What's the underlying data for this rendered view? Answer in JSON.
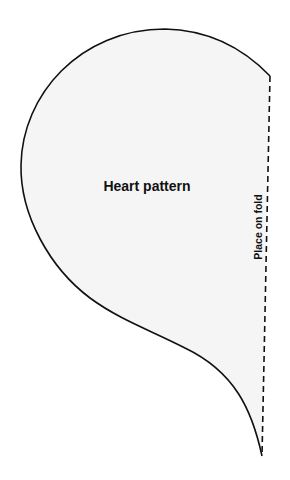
{
  "pattern": {
    "title": "Heart pattern",
    "fold_label": "Place on fold",
    "fill_color": "#f5f5f5",
    "outline_color": "#111111",
    "fold_line_style": "dashed"
  }
}
